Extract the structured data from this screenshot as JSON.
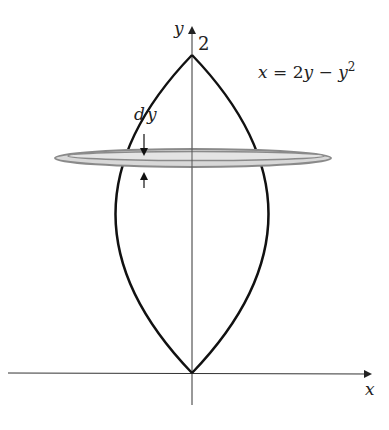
{
  "figure": {
    "type": "solid-of-revolution",
    "axes": {
      "x_label": "x",
      "y_label": "y",
      "y_tick_label": "2"
    },
    "curve_label": {
      "lhs": "x = 2",
      "var": "y",
      "minus": " − ",
      "var2": "y",
      "exp": "2"
    },
    "slice_label": {
      "d": "d",
      "y": "y"
    },
    "colors": {
      "curve": "#111111",
      "axis": "#333333",
      "disc_fill": "#d8d8d8",
      "disc_stroke": "#8a8a8a"
    }
  }
}
